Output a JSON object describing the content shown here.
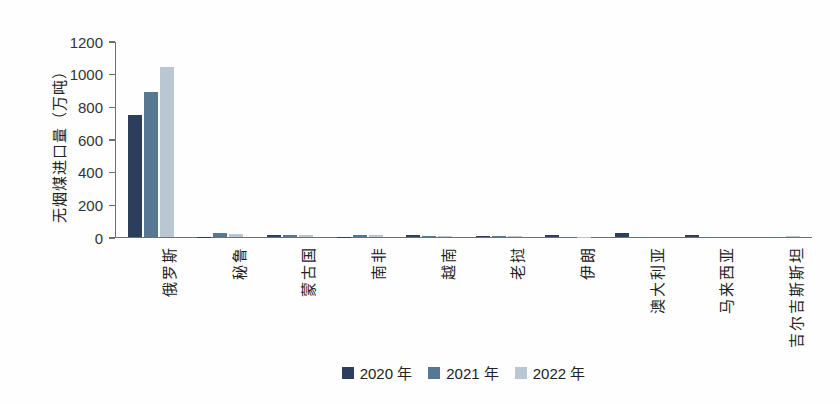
{
  "figure": {
    "background": "#fefefe",
    "axis_color": "#6f6f6f",
    "text_color": "#222222"
  },
  "chart_data": {
    "type": "bar",
    "title": "",
    "xlabel": "",
    "ylabel": "无烟煤进口量（万吨）",
    "ylim": [
      0,
      1200
    ],
    "yticks": [
      0,
      200,
      400,
      600,
      800,
      1000,
      1200
    ],
    "grid": false,
    "legend_position": "bottom",
    "categories": [
      "俄罗斯",
      "秘鲁",
      "蒙古国",
      "南非",
      "越南",
      "老挝",
      "伊朗",
      "澳大利亚",
      "马来西亚",
      "吉尔吉斯斯坦"
    ],
    "series": [
      {
        "name": "2020 年",
        "color": "#2b3f5c",
        "values": [
          750,
          3,
          15,
          3,
          12,
          9,
          15,
          22,
          10,
          0
        ]
      },
      {
        "name": "2021 年",
        "color": "#567892",
        "values": [
          890,
          22,
          14,
          10,
          9,
          6,
          3,
          2,
          2,
          1
        ]
      },
      {
        "name": "2022 年",
        "color": "#b9c7d3",
        "values": [
          1040,
          18,
          10,
          10,
          4,
          9,
          2,
          0,
          0,
          5
        ]
      }
    ]
  }
}
